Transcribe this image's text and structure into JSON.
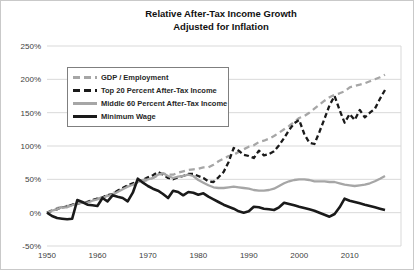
{
  "chart": {
    "title_line1": "Relative After-Tax Income Growth",
    "title_line2": "Adjusted for Inflation"
  },
  "chart_data": {
    "type": "line",
    "title": "Relative After-Tax Income Growth",
    "subtitle": "Adjusted for Inflation",
    "xlabel": "",
    "ylabel": "",
    "x_start": 1950,
    "x_end": 2017,
    "xticks": [
      1950,
      1960,
      1970,
      1980,
      1990,
      2000,
      2010
    ],
    "yticks": [
      250,
      200,
      150,
      100,
      50,
      0,
      -50
    ],
    "ytick_suffix": "%",
    "ylim": [
      -50,
      250
    ],
    "grid": "horizontal",
    "grid_color": "#d9d9d9",
    "legend_position": "upper-left",
    "series": [
      {
        "name": "GDP / Employment",
        "color": "#a6a6a6",
        "style": "dashed",
        "values": [
          0,
          4,
          7,
          9,
          10,
          12,
          13,
          15,
          16,
          19,
          21,
          23,
          26,
          29,
          33,
          37,
          40,
          42,
          45,
          47,
          49,
          52,
          56,
          59,
          57,
          57,
          60,
          62,
          64,
          65,
          66,
          68,
          68,
          72,
          77,
          81,
          85,
          87,
          91,
          95,
          99,
          101,
          106,
          108,
          111,
          115,
          120,
          125,
          130,
          136,
          142,
          145,
          150,
          156,
          162,
          168,
          173,
          177,
          179,
          182,
          188,
          190,
          192,
          194,
          197,
          200,
          203,
          207
        ]
      },
      {
        "name": "Top 20 Percent After-Tax Income",
        "color": "#1a1a1a",
        "style": "dashed",
        "values": [
          0,
          3,
          5,
          8,
          9,
          12,
          14,
          15,
          16,
          19,
          21,
          23,
          26,
          28,
          33,
          37,
          41,
          44,
          47,
          49,
          53,
          56,
          61,
          57,
          52,
          50,
          53,
          55,
          58,
          58,
          55,
          52,
          47,
          46,
          53,
          61,
          76,
          97,
          93,
          87,
          85,
          82,
          93,
          86,
          88,
          92,
          101,
          112,
          124,
          134,
          139,
          118,
          105,
          103,
          121,
          141,
          161,
          175,
          154,
          135,
          148,
          139,
          154,
          143,
          150,
          156,
          171,
          184
        ]
      },
      {
        "name": "Middle 60 Percent After-Tax Income",
        "color": "#a6a6a6",
        "style": "solid",
        "values": [
          0,
          3,
          5,
          8,
          8,
          11,
          14,
          15,
          15,
          18,
          20,
          22,
          25,
          27,
          31,
          35,
          39,
          42,
          46,
          49,
          50,
          52,
          57,
          59,
          55,
          52,
          54,
          55,
          57,
          55,
          49,
          45,
          41,
          38,
          37,
          37,
          38,
          39,
          38,
          37,
          36,
          34,
          33,
          33,
          34,
          36,
          40,
          44,
          47,
          49,
          50,
          50,
          49,
          47,
          47,
          47,
          46,
          46,
          44,
          42,
          41,
          40,
          41,
          42,
          44,
          47,
          51,
          55
        ]
      },
      {
        "name": "Minimum Wage",
        "color": "#1a1a1a",
        "style": "solid",
        "values": [
          0,
          -5,
          -8,
          -9,
          -10,
          -9,
          19,
          16,
          12,
          11,
          10,
          22,
          17,
          26,
          24,
          22,
          17,
          30,
          51,
          45,
          40,
          36,
          33,
          28,
          22,
          33,
          31,
          26,
          31,
          30,
          27,
          29,
          24,
          20,
          16,
          12,
          9,
          6,
          2,
          0,
          2,
          9,
          8,
          6,
          5,
          4,
          8,
          15,
          13,
          11,
          9,
          7,
          5,
          3,
          0,
          -3,
          -6,
          -2,
          8,
          21,
          18,
          16,
          14,
          12,
          10,
          8,
          6,
          4
        ]
      }
    ]
  }
}
